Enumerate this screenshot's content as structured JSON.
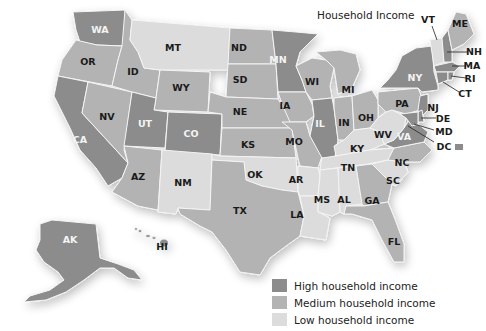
{
  "title": "Household Income",
  "colors": {
    "high": "#8c8c8c",
    "medium": "#b3b3b3",
    "low": "#dcdcdc"
  },
  "legend": [
    {
      "key": "high",
      "label": "High household income"
    },
    {
      "key": "medium",
      "label": "Medium household income"
    },
    {
      "key": "low",
      "label": "Low household income"
    }
  ],
  "states": {
    "WA": "high",
    "OR": "medium",
    "CA": "high",
    "NV": "medium",
    "ID": "medium",
    "MT": "low",
    "WY": "medium",
    "UT": "high",
    "CO": "high",
    "AZ": "medium",
    "NM": "low",
    "ND": "medium",
    "SD": "medium",
    "NE": "medium",
    "KS": "medium",
    "OK": "low",
    "TX": "medium",
    "MN": "high",
    "IA": "medium",
    "MO": "medium",
    "AR": "low",
    "LA": "low",
    "WI": "medium",
    "IL": "high",
    "MI": "medium",
    "IN": "medium",
    "OH": "medium",
    "KY": "low",
    "TN": "low",
    "MS": "low",
    "AL": "low",
    "GA": "medium",
    "FL": "medium",
    "SC": "low",
    "NC": "medium",
    "VA": "high",
    "WV": "low",
    "PA": "medium",
    "NY": "high",
    "VT": "low",
    "NH": "high",
    "ME": "medium",
    "MA": "high",
    "RI": "high",
    "CT": "high",
    "NJ": "high",
    "DE": "high",
    "MD": "high",
    "DC": "high",
    "AK": "high",
    "HI": "high"
  },
  "labels": {
    "WA": "WA",
    "OR": "OR",
    "CA": "CA",
    "NV": "NV",
    "ID": "ID",
    "MT": "MT",
    "WY": "WY",
    "UT": "UT",
    "CO": "CO",
    "AZ": "AZ",
    "NM": "NM",
    "ND": "ND",
    "SD": "SD",
    "NE": "NE",
    "KS": "KS",
    "OK": "OK",
    "TX": "TX",
    "MN": "MN",
    "IA": "IA",
    "MO": "MO",
    "AR": "AR",
    "LA": "LA",
    "WI": "WI",
    "IL": "IL",
    "MI": "MI",
    "IN": "IN",
    "OH": "OH",
    "KY": "KY",
    "TN": "TN",
    "MS": "MS",
    "AL": "AL",
    "GA": "GA",
    "FL": "FL",
    "SC": "SC",
    "NC": "NC",
    "VA": "VA",
    "WV": "WV",
    "PA": "PA",
    "NY": "NY",
    "VT": "VT",
    "NH": "NH",
    "ME": "ME",
    "MA": "MA",
    "RI": "RI",
    "CT": "CT",
    "NJ": "NJ",
    "DE": "DE",
    "MD": "MD",
    "DC": "DC",
    "AK": "AK",
    "HI": "HI"
  }
}
